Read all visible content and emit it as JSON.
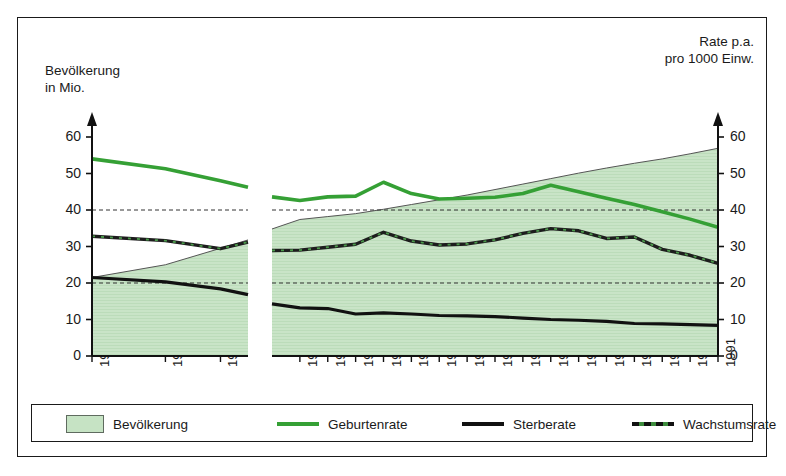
{
  "chart_data": {
    "type": "area",
    "title": "",
    "left_axis": {
      "label": "Bevölkerung\nin Mio.",
      "label_line1": "Bevölkerung",
      "label_line2": "in Mio.",
      "ticks": [
        0,
        10,
        20,
        30,
        40,
        50,
        60
      ],
      "ylim": [
        0,
        63
      ]
    },
    "right_axis": {
      "label_line1": "Rate p.a.",
      "label_line2": "pro 1000 Einw.",
      "ticks": [
        0,
        10,
        20,
        30,
        40,
        50,
        60
      ],
      "ylim": [
        0,
        63
      ]
    },
    "x_tick_labels": [
      "1952",
      "1960",
      "1966",
      "1976",
      "1977",
      "1978",
      "1979",
      "1980",
      "1981",
      "1982",
      "1983",
      "1984",
      "1985",
      "1986",
      "1987",
      "1988",
      "1989",
      "1990",
      "1991"
    ],
    "axis_break": true,
    "grid": false,
    "reference_lines": [
      40,
      20
    ],
    "legend_position": "bottom",
    "colors": {
      "area_fill": "#c6e3c4",
      "area_edge": "#555555",
      "geburtenrate": "#35A035",
      "sterberate": "#111111",
      "wachstumsrate": "#1d1d1d",
      "frame": "#1a1a1a"
    },
    "segments": [
      {
        "name": "left-panel",
        "x": [
          1952,
          1960,
          1966,
          1969
        ],
        "series": [
          {
            "name": "Bevölkerung",
            "axis": "left",
            "values": [
              21.5,
              25.0,
              29.5,
              31.8
            ]
          },
          {
            "name": "Geburtenrate",
            "axis": "right",
            "values": [
              54.0,
              51.3,
              48.0,
              46.2
            ]
          },
          {
            "name": "Sterberate",
            "axis": "right",
            "values": [
              21.5,
              20.3,
              18.4,
              16.8
            ]
          },
          {
            "name": "Wachstumsrate",
            "axis": "right",
            "values": [
              32.8,
              31.6,
              29.4,
              31.2
            ]
          }
        ]
      },
      {
        "name": "right-panel",
        "x": [
          1975,
          1976,
          1977,
          1978,
          1979,
          1980,
          1981,
          1982,
          1983,
          1984,
          1985,
          1986,
          1987,
          1988,
          1989,
          1990,
          1991
        ],
        "series": [
          {
            "name": "Bevölkerung",
            "axis": "left",
            "values": [
              34.8,
              37.4,
              38.2,
              39.0,
              40.2,
              41.5,
              42.8,
              44.1,
              45.6,
              47.1,
              48.6,
              50.1,
              51.5,
              52.8,
              54.0,
              55.4,
              56.9
            ]
          },
          {
            "name": "Geburtenrate",
            "axis": "right",
            "values": [
              43.6,
              42.6,
              43.6,
              43.8,
              47.6,
              44.5,
              43.0,
              43.2,
              43.5,
              44.5,
              46.8,
              45.0,
              43.2,
              41.5,
              39.5,
              37.5,
              35.3
            ]
          },
          {
            "name": "Sterberate",
            "axis": "right",
            "values": [
              14.3,
              13.2,
              13.0,
              11.5,
              11.8,
              11.5,
              11.1,
              11.0,
              10.8,
              10.4,
              10.0,
              9.8,
              9.5,
              8.9,
              8.8,
              8.6,
              8.4
            ]
          },
          {
            "name": "Wachstumsrate",
            "axis": "right",
            "values": [
              28.9,
              29.0,
              29.8,
              30.6,
              33.9,
              31.5,
              30.4,
              30.7,
              31.8,
              33.6,
              34.9,
              34.3,
              32.2,
              32.6,
              29.2,
              27.6,
              25.4
            ]
          }
        ]
      }
    ]
  },
  "chart": {
    "left_axis_title_1": "Bevölkerung",
    "left_axis_title_2": "in Mio.",
    "right_axis_title_1": "Rate p.a.",
    "right_axis_title_2": "pro 1000 Einw.",
    "left_ticks": [
      "60",
      "50",
      "40",
      "30",
      "20",
      "10",
      "0"
    ],
    "right_ticks": [
      "60",
      "50",
      "40",
      "30",
      "20",
      "10",
      "0"
    ],
    "x_labels": [
      "1952",
      "1960",
      "1966",
      "1976",
      "1977",
      "1978",
      "1979",
      "1980",
      "1981",
      "1982",
      "1983",
      "1984",
      "1985",
      "1986",
      "1987",
      "1988",
      "1989",
      "1990",
      "1991"
    ]
  },
  "legend": {
    "items": [
      {
        "label": "Bevölkerung",
        "marker": "area-swatch"
      },
      {
        "label": "Geburtenrate",
        "marker": "green-line"
      },
      {
        "label": "Sterberate",
        "marker": "black-line"
      },
      {
        "label": "Wachstumsrate",
        "marker": "dashed-line"
      }
    ]
  }
}
